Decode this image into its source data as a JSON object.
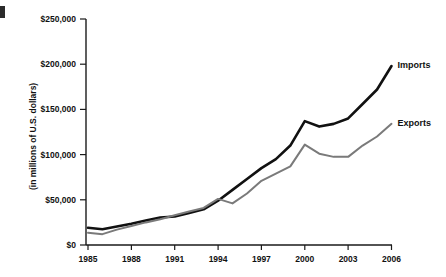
{
  "chart_data": {
    "type": "line",
    "title": "",
    "subtitle": "",
    "xlabel": "",
    "ylabel": "(in millions of U.S. dollars)",
    "x": [
      1985,
      1986,
      1987,
      1988,
      1989,
      1990,
      1991,
      1992,
      1993,
      1994,
      1995,
      1996,
      1997,
      1998,
      1999,
      2000,
      2001,
      2002,
      2003,
      2004,
      2005,
      2006
    ],
    "xticks": [
      "1985",
      "1988",
      "1991",
      "1994",
      "1997",
      "2000",
      "2003",
      "2006"
    ],
    "xtick_values": [
      1985,
      1988,
      1991,
      1994,
      1997,
      2000,
      2003,
      2006
    ],
    "yticks": [
      "$0",
      "$50,000",
      "$100,000",
      "$150,000",
      "$200,000",
      "$250,000"
    ],
    "ytick_values": [
      0,
      50000,
      100000,
      150000,
      200000,
      250000
    ],
    "xlim": [
      1985,
      2006
    ],
    "ylim": [
      0,
      250000
    ],
    "grid": false,
    "legend_position": "right-inline",
    "series": [
      {
        "name": "Imports",
        "color": "#111111",
        "width": 2.6,
        "values": [
          19000,
          17500,
          20500,
          23500,
          27000,
          30500,
          31500,
          35500,
          39500,
          49000,
          61000,
          73000,
          85000,
          95000,
          110000,
          137000,
          131000,
          134000,
          140000,
          156000,
          172000,
          198000
        ]
      },
      {
        "name": "Exports",
        "color": "#7a7a7a",
        "width": 2.0,
        "values": [
          13500,
          12000,
          17000,
          21000,
          25000,
          28500,
          33000,
          37000,
          41000,
          51000,
          46000,
          57000,
          71000,
          79000,
          87000,
          111000,
          101000,
          97500,
          97500,
          110000,
          120000,
          134000
        ]
      }
    ],
    "annotations": [
      {
        "name": "imports-label",
        "text": "Imports",
        "x": 2006,
        "y": 198000
      },
      {
        "name": "exports-label",
        "text": "Exports",
        "x": 2006,
        "y": 134000
      }
    ]
  }
}
